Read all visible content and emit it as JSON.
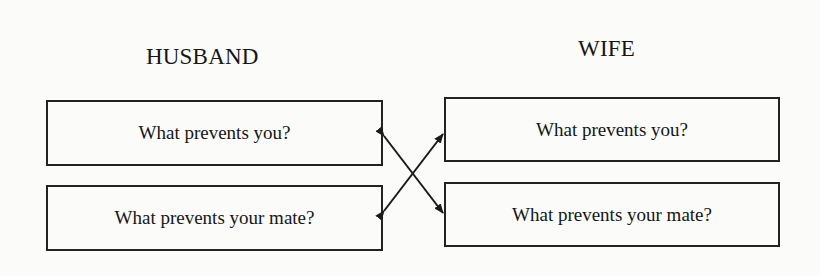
{
  "diagram": {
    "columns": [
      {
        "heading": "HUSBAND",
        "boxes": [
          "What prevents you?",
          "What prevents your mate?"
        ]
      },
      {
        "heading": "WIFE",
        "boxes": [
          "What prevents you?",
          "What prevents your mate?"
        ]
      }
    ],
    "connections": [
      {
        "from": "husband.what-prevents-you",
        "to": "wife.what-prevents-your-mate",
        "type": "double-arrow"
      },
      {
        "from": "husband.what-prevents-your-mate",
        "to": "wife.what-prevents-you",
        "type": "double-arrow"
      }
    ]
  }
}
